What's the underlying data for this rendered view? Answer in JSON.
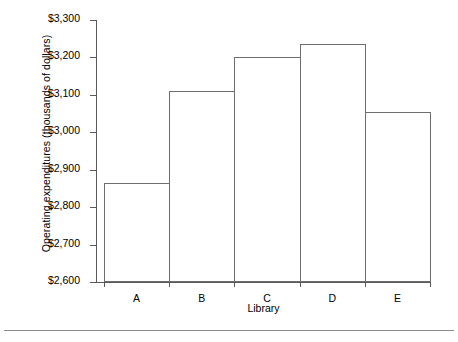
{
  "chart_data": {
    "type": "bar",
    "title": "",
    "subtitle": "",
    "xlabel": "Library",
    "ylabel": "Operating expenditures (thousands of dollars)",
    "categories": [
      "A",
      "B",
      "C",
      "D",
      "E"
    ],
    "values": [
      2865,
      3110,
      3200,
      3235,
      3055
    ],
    "value_unit": "thousands of dollars",
    "ylim": [
      2600,
      3300
    ],
    "ytick_values": [
      2600,
      2700,
      2800,
      2900,
      3000,
      3100,
      3200,
      3300
    ],
    "ytick_labels": [
      "$2,600",
      "$2,700",
      "$2,800",
      "$2,900",
      "$3,000",
      "$3,100",
      "$3,200",
      "$3,300"
    ],
    "grid": false,
    "legend": null,
    "legend_position": "none",
    "bars_contiguous": true,
    "bar_fill": "#ffffff",
    "bar_stroke": "#6e6e6e",
    "axis_color": "#5a5a5a"
  },
  "axes": {
    "y_title": "Operating expenditures (thousands of dollars)",
    "x_title": "Library"
  }
}
